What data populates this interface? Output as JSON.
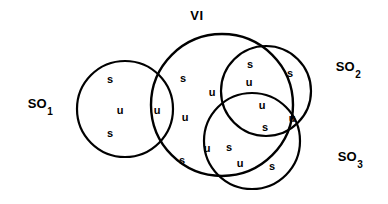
{
  "diagram": {
    "title": "VI",
    "title_position": {
      "x": 197,
      "y": 15
    },
    "background_color": "#ffffff",
    "stroke_color": "#000000",
    "stroke_width": 2.2,
    "canvas": {
      "width": 388,
      "height": 204
    },
    "circles": [
      {
        "name": "so1-circle",
        "cx": 125,
        "cy": 109,
        "r": 48
      },
      {
        "name": "vi-circle",
        "cx": 222,
        "cy": 105,
        "r": 71
      },
      {
        "name": "so2-circle",
        "cx": 266,
        "cy": 91,
        "r": 45
      },
      {
        "name": "so3-circle",
        "cx": 252,
        "cy": 141,
        "r": 48
      }
    ],
    "set_labels": [
      {
        "name": "so1-label",
        "base": "SO",
        "sub": "1",
        "x": 40,
        "y": 105
      },
      {
        "name": "so2-label",
        "base": "SO",
        "sub": "2",
        "x": 348,
        "y": 68
      },
      {
        "name": "so3-label",
        "base": "SO",
        "sub": "3",
        "x": 350,
        "y": 158
      }
    ],
    "region_letters": [
      {
        "name": "letter-so1-upper",
        "text": "s",
        "x": 110,
        "y": 79
      },
      {
        "name": "letter-so1-mid",
        "text": "u",
        "x": 120,
        "y": 110
      },
      {
        "name": "letter-so1-lower",
        "text": "s",
        "x": 110,
        "y": 133
      },
      {
        "name": "letter-so1-vi-overlap",
        "text": "u",
        "x": 157,
        "y": 110
      },
      {
        "name": "letter-vi-upper-left",
        "text": "s",
        "x": 183,
        "y": 78
      },
      {
        "name": "letter-vi-mid-left",
        "text": "u",
        "x": 185,
        "y": 117
      },
      {
        "name": "letter-vi-lower-left",
        "text": "s",
        "x": 182,
        "y": 160
      },
      {
        "name": "letter-vi-center-left",
        "text": "u",
        "x": 212,
        "y": 92
      },
      {
        "name": "letter-vi-so2-upper",
        "text": "s",
        "x": 250,
        "y": 64
      },
      {
        "name": "letter-vi-so2-lower",
        "text": "u",
        "x": 249,
        "y": 82
      },
      {
        "name": "letter-so2-right",
        "text": "s",
        "x": 290,
        "y": 73
      },
      {
        "name": "letter-triple-upper",
        "text": "u",
        "x": 262,
        "y": 105
      },
      {
        "name": "letter-triple-lower",
        "text": "s",
        "x": 265,
        "y": 127
      },
      {
        "name": "letter-so2-so3-right",
        "text": "u",
        "x": 292,
        "y": 118
      },
      {
        "name": "letter-vi-so3-u",
        "text": "u",
        "x": 207,
        "y": 148
      },
      {
        "name": "letter-vi-so3-s",
        "text": "s",
        "x": 229,
        "y": 147
      },
      {
        "name": "letter-so3-mid",
        "text": "u",
        "x": 240,
        "y": 163
      },
      {
        "name": "letter-so3-right",
        "text": "s",
        "x": 272,
        "y": 166
      }
    ]
  }
}
